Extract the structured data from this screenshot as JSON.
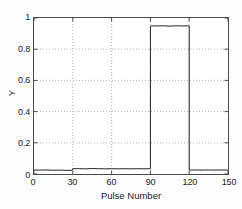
{
  "chart_data": {
    "type": "line",
    "title": "",
    "subtitle": "",
    "xlabel": "Pulse Number",
    "ylabel": "Y",
    "xlim": [
      0,
      150
    ],
    "ylim": [
      0,
      1
    ],
    "xticks": [
      0,
      30,
      60,
      90,
      120,
      150
    ],
    "xtick_labels": [
      "0",
      "30",
      "60",
      "90",
      "120",
      "150"
    ],
    "yticks": [
      0,
      0.2,
      0.4,
      0.6,
      0.8,
      1
    ],
    "ytick_labels": [
      "0",
      "0.2",
      "0.4",
      "0.6",
      "0.8",
      "1"
    ],
    "grid": true,
    "grid_style": "dotted",
    "grid_color": "#b0b0b0",
    "legend": null,
    "legend_position": "none",
    "line_color": "#222222",
    "line_width": 1,
    "background_color": "#ffffff",
    "axis_color": "#4a4a4a",
    "series": [
      {
        "name": "Y",
        "x": [
          0,
          5,
          10,
          15,
          20,
          25,
          29.5,
          30,
          35,
          40,
          45,
          50,
          55,
          60,
          65,
          70,
          75,
          80,
          85,
          89.5,
          90,
          90,
          92,
          95,
          100,
          105,
          110,
          115,
          119.5,
          120,
          120,
          122,
          125,
          130,
          135,
          140,
          145,
          150
        ],
        "y": [
          0.025,
          0.025,
          0.026,
          0.024,
          0.025,
          0.023,
          0.024,
          0.034,
          0.034,
          0.033,
          0.035,
          0.034,
          0.033,
          0.034,
          0.033,
          0.034,
          0.033,
          0.034,
          0.033,
          0.034,
          0.034,
          0.948,
          0.95,
          0.949,
          0.95,
          0.948,
          0.95,
          0.949,
          0.95,
          0.95,
          0.026,
          0.025,
          0.026,
          0.025,
          0.026,
          0.025,
          0.026,
          0.025
        ]
      }
    ],
    "annotations": []
  },
  "figure": {
    "axis_title_x": "Pulse Number",
    "axis_title_y": "Y"
  }
}
